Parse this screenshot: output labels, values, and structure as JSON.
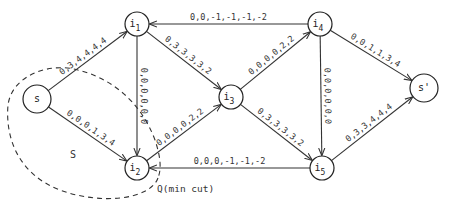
{
  "diagram": {
    "type": "flow-network",
    "nodes": [
      {
        "id": "s",
        "label": "s",
        "sub": "",
        "x": 37,
        "y": 99,
        "r": 14
      },
      {
        "id": "i1",
        "label": "i",
        "sub": "1",
        "x": 137,
        "y": 24,
        "r": 12
      },
      {
        "id": "i2",
        "label": "i",
        "sub": "2",
        "x": 137,
        "y": 168,
        "r": 12
      },
      {
        "id": "i3",
        "label": "i",
        "sub": "3",
        "x": 231,
        "y": 97,
        "r": 12
      },
      {
        "id": "i4",
        "label": "i",
        "sub": "4",
        "x": 320,
        "y": 24,
        "r": 12
      },
      {
        "id": "i5",
        "label": "i",
        "sub": "5",
        "x": 322,
        "y": 168,
        "r": 12
      },
      {
        "id": "t",
        "label": "s'",
        "sub": "",
        "x": 424,
        "y": 88,
        "r": 14
      }
    ],
    "edges": [
      {
        "from": "s",
        "to": "i1",
        "label": "0,3,4,4,4,4"
      },
      {
        "from": "s",
        "to": "i2",
        "label": "0,0,0,1,3,4"
      },
      {
        "from": "i1",
        "to": "i2",
        "label": "0,0,0,0,0,0"
      },
      {
        "from": "i1",
        "to": "i3",
        "label": "0,3,3,3,3,2"
      },
      {
        "from": "i4",
        "to": "i1",
        "label": "0,0,-1,-1,-1,-2"
      },
      {
        "from": "i2",
        "to": "i3",
        "label": "0,0,0,0,2,2"
      },
      {
        "from": "i3",
        "to": "i4",
        "label": "0,0,0,0,2,2"
      },
      {
        "from": "i3",
        "to": "i5",
        "label": "0,3,3,3,3,2"
      },
      {
        "from": "i4",
        "to": "i5",
        "label": "0,0,0,0,0,0"
      },
      {
        "from": "i5",
        "to": "i2",
        "label": "0,0,0,-1,-1,-2"
      },
      {
        "from": "i4",
        "to": "t",
        "label": "0,0,1,1,3,4"
      },
      {
        "from": "i5",
        "to": "t",
        "label": "0,3,3,4,4,4"
      }
    ],
    "region_label": "S",
    "cut_label": "Q(min cut)"
  }
}
